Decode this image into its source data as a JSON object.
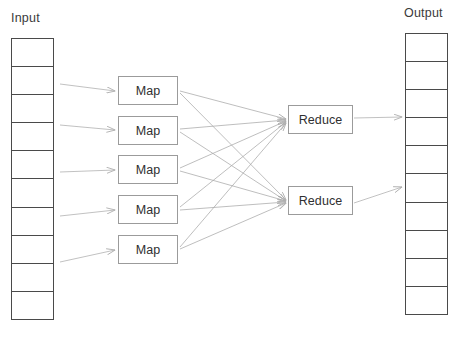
{
  "diagram": {
    "colors": {
      "stack_border": "#4a4a4a",
      "node_border": "#9b9b9b",
      "arrow": "#b0b0b0",
      "mesh_line": "#a8a8a8",
      "text": "#2f2f2f",
      "background": "#ffffff"
    },
    "input": {
      "label": "Input",
      "cell_count": 10,
      "cells": [
        "",
        "",
        "",
        "",
        "",
        "",
        "",
        "",
        "",
        ""
      ]
    },
    "output": {
      "label": "Output",
      "cell_count": 10,
      "cells": [
        "",
        "",
        "",
        "",
        "",
        "",
        "",
        "",
        "",
        ""
      ]
    },
    "mappers": [
      {
        "label": "Map"
      },
      {
        "label": "Map"
      },
      {
        "label": "Map"
      },
      {
        "label": "Map"
      },
      {
        "label": "Map"
      }
    ],
    "reducers": [
      {
        "label": "Reduce"
      },
      {
        "label": "Reduce"
      }
    ],
    "edges": {
      "input_to_map_count": 5,
      "map_to_reduce_count": 10,
      "reduce_to_output_count": 2
    }
  }
}
